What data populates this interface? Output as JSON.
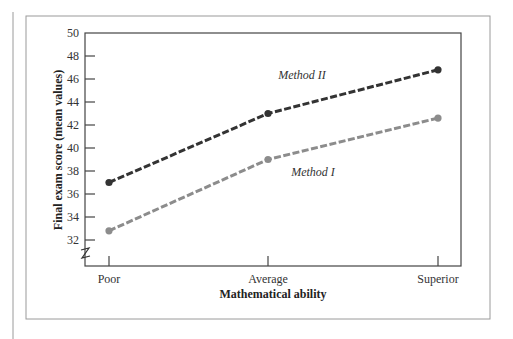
{
  "chart_data": {
    "type": "line",
    "title": "",
    "xlabel": "Mathematical ability",
    "ylabel": "Final exam score (mean values)",
    "categories": [
      "Poor",
      "Average",
      "Superior"
    ],
    "y_ticks": [
      32,
      34,
      36,
      38,
      40,
      42,
      44,
      46,
      48,
      50
    ],
    "ylim": [
      32,
      50
    ],
    "y_axis_break": true,
    "grid": false,
    "legend": "inline-labels",
    "series": [
      {
        "name": "Method II",
        "label": "Method II",
        "color": "#333333",
        "values": [
          37.0,
          43.0,
          46.8
        ]
      },
      {
        "name": "Method I",
        "label": "Method I",
        "color": "#8c8c8c",
        "values": [
          32.8,
          39.0,
          42.6
        ]
      }
    ]
  }
}
